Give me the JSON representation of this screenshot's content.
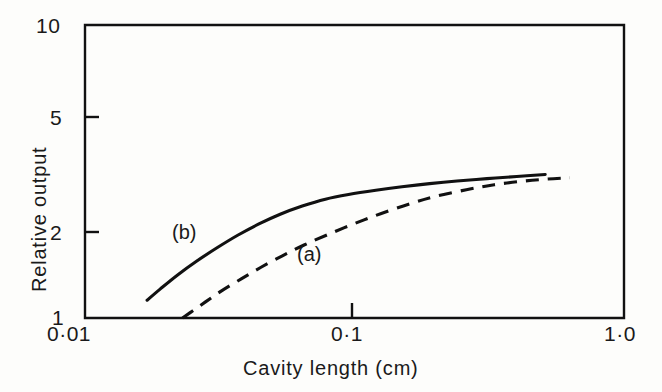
{
  "chart_data": {
    "type": "line",
    "title": "",
    "xlabel": "Cavity length (cm)",
    "ylabel": "Relative output",
    "xscale": "log",
    "yscale": "log",
    "xlim": [
      0.01,
      1.0
    ],
    "ylim": [
      1,
      10
    ],
    "grid": false,
    "legend_position": "inline-annotations",
    "xticks": [
      {
        "value": 0.01,
        "label": "0·01"
      },
      {
        "value": 0.1,
        "label": "0·1"
      },
      {
        "value": 1.0,
        "label": "1·0"
      }
    ],
    "yticks": [
      {
        "value": 1,
        "label": "1"
      },
      {
        "value": 2,
        "label": "2"
      },
      {
        "value": 5,
        "label": "5"
      },
      {
        "value": 10,
        "label": "10"
      }
    ],
    "series": [
      {
        "name": "(a)",
        "style": "dashed",
        "color": "#111111",
        "annotation": "(a)",
        "x": [
          0.023,
          0.025,
          0.028,
          0.032,
          0.038,
          0.045,
          0.054,
          0.065,
          0.08,
          0.1,
          0.125,
          0.16,
          0.2,
          0.26,
          0.33,
          0.42,
          0.52,
          0.63
        ],
        "y": [
          1.0,
          1.055,
          1.135,
          1.235,
          1.36,
          1.49,
          1.63,
          1.775,
          1.93,
          2.1,
          2.27,
          2.45,
          2.6,
          2.74,
          2.85,
          2.93,
          2.98,
          3.01
        ]
      },
      {
        "name": "(b)",
        "style": "solid",
        "color": "#111111",
        "annotation": "(b)",
        "x": [
          0.017,
          0.019,
          0.022,
          0.026,
          0.031,
          0.037,
          0.044,
          0.053,
          0.064,
          0.078,
          0.095,
          0.12,
          0.15,
          0.19,
          0.24,
          0.31,
          0.4,
          0.51
        ],
        "y": [
          1.15,
          1.255,
          1.4,
          1.565,
          1.74,
          1.92,
          2.09,
          2.26,
          2.41,
          2.545,
          2.64,
          2.73,
          2.805,
          2.875,
          2.935,
          2.99,
          3.04,
          3.09
        ]
      }
    ]
  },
  "axes": {
    "frame": {
      "left": 85,
      "right": 624,
      "top": 25,
      "bottom": 318
    }
  },
  "labels": {
    "ytick_10": "10",
    "ytick_5": "5",
    "ytick_2": "2",
    "ytick_1": "1",
    "xtick_001": "0·01",
    "xtick_01": "0·1",
    "xtick_10": "1·0",
    "xaxis_title": "Cavity length (cm)",
    "yaxis_title": "Relative output",
    "curve_a": "(a)",
    "curve_b": "(b)"
  }
}
